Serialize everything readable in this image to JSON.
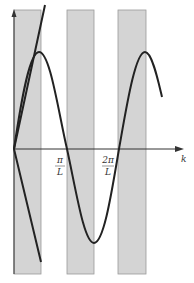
{
  "figure": {
    "axis_x_label": "k",
    "tick_labels": [
      {
        "num": "π",
        "den": "L"
      },
      {
        "num": "2π",
        "den": "L"
      }
    ],
    "colors": {
      "band": "#d4d4d4",
      "band_edge": "#9a9a9a",
      "curve": "#222222",
      "axis": "#333333"
    },
    "bands": [
      {
        "x0": 14,
        "x1": 41
      },
      {
        "x0": 67,
        "x1": 94
      },
      {
        "x0": 118,
        "x1": 146
      }
    ],
    "curves": [
      "linear dispersion line",
      "sinusoidal dispersion curve"
    ]
  }
}
